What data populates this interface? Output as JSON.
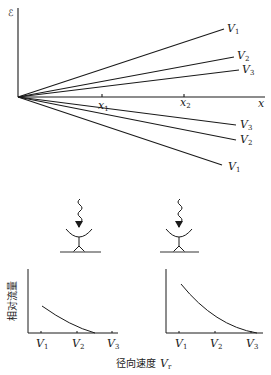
{
  "top_plot": {
    "y_axis_label": "ℰ",
    "x_axis_label": "x",
    "x_ticks": [
      {
        "label": "x",
        "sub": "1"
      },
      {
        "label": "x",
        "sub": "2"
      }
    ],
    "upper_lines": [
      {
        "label": "V",
        "sub": "1"
      },
      {
        "label": "V",
        "sub": "2"
      },
      {
        "label": "V",
        "sub": "3"
      }
    ],
    "lower_lines": [
      {
        "label": "V",
        "sub": "3"
      },
      {
        "label": "V",
        "sub": "2"
      },
      {
        "label": "V",
        "sub": "1"
      }
    ]
  },
  "detectors": [
    {
      "position": "x1"
    },
    {
      "position": "x2"
    }
  ],
  "bottom_plots": {
    "y_axis_label": "相对流量",
    "x_axis_label_text": "径向速度",
    "x_axis_label_var": "V",
    "x_axis_label_sub": "r",
    "left_ticks": [
      {
        "label": "V",
        "sub": "1"
      },
      {
        "label": "V",
        "sub": "2"
      },
      {
        "label": "V",
        "sub": "3"
      }
    ],
    "right_ticks": [
      {
        "label": "V",
        "sub": "1"
      },
      {
        "label": "V",
        "sub": "2"
      },
      {
        "label": "V",
        "sub": "3"
      }
    ]
  },
  "colors": {
    "line": "#1a1a1a",
    "detector_base": "#777777"
  }
}
